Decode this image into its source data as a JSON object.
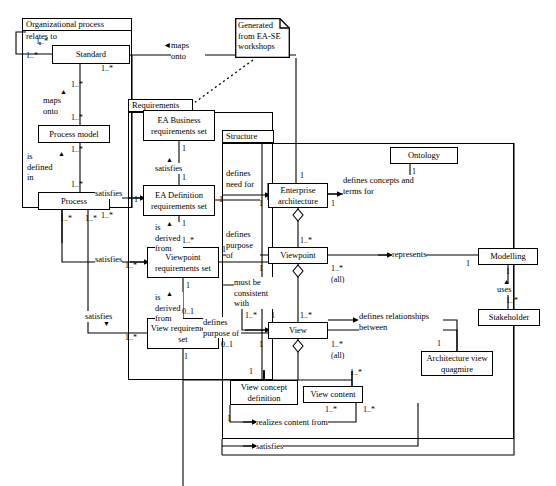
{
  "diagram": {
    "type": "uml-class-diagram",
    "width": 556,
    "height": 486,
    "stroke_color": "#000000",
    "background_color": "#ffffff"
  },
  "packages": [
    {
      "name": "Organizational process",
      "x": 22,
      "y": 28,
      "w": 110,
      "h": 180,
      "tab_x": 22,
      "tab_y": 18,
      "tab_w": 110,
      "tab_h": 13
    },
    {
      "name": "Requirements",
      "x": 128,
      "y": 112,
      "w": 145,
      "h": 268,
      "tab_x": 128,
      "tab_y": 99,
      "tab_w": 65,
      "tab_h": 13
    },
    {
      "name": "Structure",
      "x": 222,
      "y": 143,
      "w": 292,
      "h": 296,
      "tab_x": 222,
      "tab_y": 130,
      "tab_w": 52,
      "tab_h": 13
    }
  ],
  "classes": [
    {
      "id": "standard",
      "label": "Standard",
      "x": 52,
      "y": 45,
      "w": 78,
      "h": 19
    },
    {
      "id": "process-model",
      "label": "Process model",
      "x": 38,
      "y": 125,
      "w": 72,
      "h": 18
    },
    {
      "id": "process",
      "label": "Process",
      "x": 38,
      "y": 192,
      "w": 72,
      "h": 18
    },
    {
      "id": "ea-business-req",
      "label": "EA Business requirements set",
      "x": 143,
      "y": 110,
      "w": 72,
      "h": 31
    },
    {
      "id": "ea-definition-req",
      "label": "EA Definition requirements set",
      "x": 143,
      "y": 185,
      "w": 72,
      "h": 31
    },
    {
      "id": "viewpoint-req",
      "label": "Viewpoint requirements set",
      "x": 147,
      "y": 247,
      "w": 72,
      "h": 31
    },
    {
      "id": "view-req",
      "label": "View requirements set",
      "x": 147,
      "y": 318,
      "w": 72,
      "h": 31
    },
    {
      "id": "enterprise-arch",
      "label": "Enterprise architecture",
      "x": 268,
      "y": 183,
      "w": 60,
      "h": 25
    },
    {
      "id": "ontology",
      "label": "Ontology",
      "x": 390,
      "y": 147,
      "w": 68,
      "h": 17
    },
    {
      "id": "viewpoint",
      "label": "Viewpoint",
      "x": 268,
      "y": 247,
      "w": 60,
      "h": 17
    },
    {
      "id": "view",
      "label": "View",
      "x": 268,
      "y": 322,
      "w": 60,
      "h": 17
    },
    {
      "id": "view-concept",
      "label": "View concept definition",
      "x": 230,
      "y": 380,
      "w": 68,
      "h": 25
    },
    {
      "id": "view-content",
      "label": "View content",
      "x": 303,
      "y": 386,
      "w": 60,
      "h": 17
    },
    {
      "id": "arch-view-quag",
      "label": "Architecture view quagmire",
      "x": 421,
      "y": 351,
      "w": 72,
      "h": 25
    },
    {
      "id": "modelling",
      "label": "Modelling",
      "x": 478,
      "y": 248,
      "w": 60,
      "h": 17
    },
    {
      "id": "stakeholder",
      "label": "Stakeholder",
      "x": 478,
      "y": 309,
      "w": 62,
      "h": 17
    }
  ],
  "notes": [
    {
      "id": "note-ease",
      "text": "Generated from EA-SE workshops",
      "x": 235,
      "y": 18,
      "w": 55,
      "h": 40
    }
  ],
  "association_labels": [
    {
      "id": "relates-to",
      "text": "relates to",
      "x": 26,
      "y": 31
    },
    {
      "id": "maps-onto-1",
      "text": "maps onto",
      "x": 171,
      "y": 40,
      "w": 34
    },
    {
      "id": "maps-onto-2",
      "text": "maps onto",
      "x": 43,
      "y": 95,
      "w": 30
    },
    {
      "id": "is-defined-in",
      "text": "is defined in",
      "x": 27,
      "y": 151,
      "w": 30
    },
    {
      "id": "satisfies-1",
      "text": "satisfies",
      "x": 160,
      "y": 163
    },
    {
      "id": "satisfies-2",
      "text": "satisfies",
      "x": 95,
      "y": 188
    },
    {
      "id": "is-derived-from-1",
      "text": "is derived from",
      "x": 155,
      "y": 222,
      "w": 28
    },
    {
      "id": "satisfies-3",
      "text": "satisfies",
      "x": 95,
      "y": 254
    },
    {
      "id": "is-derived-from-2",
      "text": "is derived from",
      "x": 155,
      "y": 292,
      "w": 28
    },
    {
      "id": "satisfies-4",
      "text": "satisfies",
      "x": 85,
      "y": 311
    },
    {
      "id": "defines-need-for",
      "text": "defines need for",
      "x": 226,
      "y": 168,
      "w": 32
    },
    {
      "id": "defines-concepts",
      "text": "defines concepts and terms for",
      "x": 336,
      "y": 175,
      "w": 70
    },
    {
      "id": "defines-purpose-of-1",
      "text": "defines purpose of",
      "x": 226,
      "y": 229,
      "w": 34
    },
    {
      "id": "must-be-consistent",
      "text": "must be consistent with",
      "x": 234,
      "y": 277,
      "w": 40
    },
    {
      "id": "defines-purpose-of-2",
      "text": "defines purpose of",
      "x": 203,
      "y": 317,
      "w": 36
    },
    {
      "id": "defines-relationships",
      "text": "defines relationships between",
      "x": 359,
      "y": 311,
      "w": 82
    },
    {
      "id": "represents",
      "text": "represents",
      "x": 390,
      "y": 249
    },
    {
      "id": "uses",
      "text": "uses",
      "x": 497,
      "y": 284
    },
    {
      "id": "realizes-content",
      "text": "realizes content from",
      "x": 243,
      "y": 418
    },
    {
      "id": "satisfies-5",
      "text": "satisfies",
      "x": 243,
      "y": 442
    }
  ],
  "multiplicities": [
    {
      "id": "m-std-left-a",
      "text": "1..*",
      "x": 36,
      "y": 37
    },
    {
      "id": "m-std-left-b",
      "text": "1..*",
      "x": 26,
      "y": 51
    },
    {
      "id": "m-std-right",
      "text": "1..*",
      "x": 101,
      "y": 64
    },
    {
      "id": "m-std-down",
      "text": "1..*",
      "x": 71,
      "y": 80
    },
    {
      "id": "m-pm-up",
      "text": "1..*",
      "x": 71,
      "y": 113
    },
    {
      "id": "m-pm-down",
      "text": "1..*",
      "x": 71,
      "y": 145
    },
    {
      "id": "m-proc-up",
      "text": "1..*",
      "x": 71,
      "y": 180
    },
    {
      "id": "m-proc-right",
      "text": "1..*",
      "x": 101,
      "y": 211
    },
    {
      "id": "m-proc-b1",
      "text": "1..*",
      "x": 60,
      "y": 214
    },
    {
      "id": "m-proc-b2",
      "text": "1..*",
      "x": 85,
      "y": 214
    },
    {
      "id": "m-eab-down",
      "text": "1",
      "x": 180,
      "y": 144
    },
    {
      "id": "m-ead-up",
      "text": "1",
      "x": 180,
      "y": 173
    },
    {
      "id": "m-ead-left",
      "text": "1",
      "x": 135,
      "y": 199
    },
    {
      "id": "m-ead-right",
      "text": "1",
      "x": 218,
      "y": 199
    },
    {
      "id": "m-ead-down",
      "text": "1",
      "x": 180,
      "y": 219
    },
    {
      "id": "m-vpr-up",
      "text": "1..*",
      "x": 180,
      "y": 236
    },
    {
      "id": "m-vpr-left",
      "text": "1..*",
      "x": 125,
      "y": 261
    },
    {
      "id": "m-vpr-right",
      "text": "1",
      "x": 222,
      "y": 245
    },
    {
      "id": "m-vpr-down",
      "text": "1",
      "x": 183,
      "y": 281
    },
    {
      "id": "m-vr-up",
      "text": "0..1",
      "x": 180,
      "y": 307
    },
    {
      "id": "m-vr-left",
      "text": "1..*",
      "x": 125,
      "y": 333
    },
    {
      "id": "m-vr-right",
      "text": "0..1",
      "x": 221,
      "y": 340
    },
    {
      "id": "m-vr-down",
      "text": "1",
      "x": 180,
      "y": 352
    },
    {
      "id": "m-ea-up",
      "text": "1",
      "x": 297,
      "y": 172
    },
    {
      "id": "m-ea-left",
      "text": "1",
      "x": 257,
      "y": 200
    },
    {
      "id": "m-ea-right",
      "text": "1",
      "x": 331,
      "y": 200
    },
    {
      "id": "m-onto-down",
      "text": "1",
      "x": 410,
      "y": 168
    },
    {
      "id": "m-vp-up",
      "text": "1..*",
      "x": 297,
      "y": 236
    },
    {
      "id": "m-vp-left",
      "text": "1",
      "x": 257,
      "y": 265
    },
    {
      "id": "m-vp-right",
      "text": "1..*",
      "x": 331,
      "y": 264
    },
    {
      "id": "m-vp-right-all",
      "text": "(all)",
      "x": 331,
      "y": 275
    },
    {
      "id": "m-vp-down",
      "text": "1..*",
      "x": 297,
      "y": 311
    },
    {
      "id": "m-view-left",
      "text": "1..*",
      "x": 245,
      "y": 311
    },
    {
      "id": "m-view-left2",
      "text": "1",
      "x": 268,
      "y": 311
    },
    {
      "id": "m-view-bl",
      "text": "1",
      "x": 257,
      "y": 340
    },
    {
      "id": "m-view-right",
      "text": "1..*",
      "x": 331,
      "y": 340
    },
    {
      "id": "m-view-right-all",
      "text": "(all)",
      "x": 331,
      "y": 351
    },
    {
      "id": "m-vc-up",
      "text": "1",
      "x": 247,
      "y": 368
    },
    {
      "id": "m-vcont-up",
      "text": "1..*",
      "x": 348,
      "y": 369
    },
    {
      "id": "m-vc-left",
      "text": "1",
      "x": 227,
      "y": 415
    },
    {
      "id": "m-vcont-d1",
      "text": "1..*",
      "x": 325,
      "y": 405
    },
    {
      "id": "m-vcont-d2",
      "text": "1..*",
      "x": 363,
      "y": 405
    },
    {
      "id": "m-quag-up",
      "text": "1",
      "x": 435,
      "y": 340
    },
    {
      "id": "m-model-left",
      "text": "1",
      "x": 465,
      "y": 260
    },
    {
      "id": "m-model-down",
      "text": "1",
      "x": 505,
      "y": 267
    },
    {
      "id": "m-stake-up",
      "text": "1..*",
      "x": 505,
      "y": 297
    }
  ]
}
